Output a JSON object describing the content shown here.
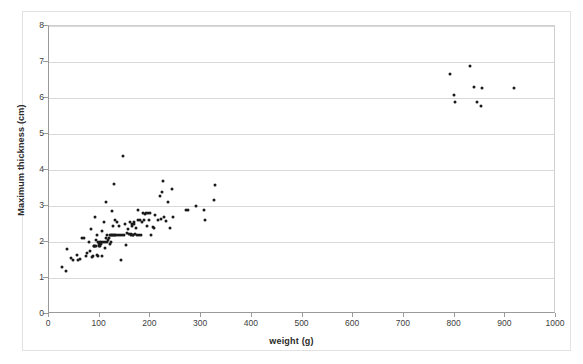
{
  "chart_data": {
    "type": "scatter",
    "title": "",
    "xlabel": "weight (g)",
    "ylabel": "Maximum thickness (cm)",
    "xlim": [
      0,
      1000
    ],
    "ylim": [
      0,
      8
    ],
    "xticks": [
      0,
      100,
      200,
      300,
      400,
      500,
      600,
      700,
      800,
      900,
      1000
    ],
    "yticks": [
      0,
      1,
      2,
      3,
      4,
      5,
      6,
      7,
      8
    ],
    "xtick_labels": [
      "0",
      "100",
      "200",
      "300",
      "400",
      "500",
      "600",
      "700",
      "800",
      "900",
      "1000"
    ],
    "ytick_labels": [
      "0",
      "1",
      "2",
      "3",
      "4",
      "5",
      "6",
      "7",
      "8"
    ],
    "grid": "horizontal",
    "legend": "none",
    "marker_color": "#1a1a1a",
    "marker_size": 3,
    "series": [
      {
        "name": "specimens",
        "points": [
          [
            25,
            1.3
          ],
          [
            34,
            1.2
          ],
          [
            36,
            1.8
          ],
          [
            44,
            1.55
          ],
          [
            48,
            1.5
          ],
          [
            55,
            1.65
          ],
          [
            58,
            1.5
          ],
          [
            62,
            1.52
          ],
          [
            66,
            2.1
          ],
          [
            70,
            2.1
          ],
          [
            72,
            1.62
          ],
          [
            75,
            1.7
          ],
          [
            78,
            2.0
          ],
          [
            80,
            1.75
          ],
          [
            82,
            2.35
          ],
          [
            84,
            1.58
          ],
          [
            86,
            1.6
          ],
          [
            88,
            1.9
          ],
          [
            89,
            1.9
          ],
          [
            90,
            2.7
          ],
          [
            91,
            1.9
          ],
          [
            92,
            1.9
          ],
          [
            93,
            2.05
          ],
          [
            94,
            2.2
          ],
          [
            95,
            1.65
          ],
          [
            96,
            1.6
          ],
          [
            97,
            2.0
          ],
          [
            98,
            1.95
          ],
          [
            99,
            1.9
          ],
          [
            100,
            2.0
          ],
          [
            101,
            1.9
          ],
          [
            102,
            2.0
          ],
          [
            103,
            1.95
          ],
          [
            104,
            1.62
          ],
          [
            105,
            2.3
          ],
          [
            106,
            2.0
          ],
          [
            108,
            2.55
          ],
          [
            110,
            1.82
          ],
          [
            111,
            2.0
          ],
          [
            112,
            2.1
          ],
          [
            113,
            3.1
          ],
          [
            114,
            2.0
          ],
          [
            115,
            2.2
          ],
          [
            116,
            2.05
          ],
          [
            118,
            2.1
          ],
          [
            120,
            2.2
          ],
          [
            121,
            1.95
          ],
          [
            122,
            2.2
          ],
          [
            123,
            2.0
          ],
          [
            124,
            2.2
          ],
          [
            125,
            2.85
          ],
          [
            126,
            2.2
          ],
          [
            127,
            2.45
          ],
          [
            128,
            3.6
          ],
          [
            129,
            2.2
          ],
          [
            130,
            2.2
          ],
          [
            131,
            2.6
          ],
          [
            132,
            2.2
          ],
          [
            134,
            2.55
          ],
          [
            136,
            2.2
          ],
          [
            138,
            2.45
          ],
          [
            140,
            2.2
          ],
          [
            142,
            1.5
          ],
          [
            144,
            2.2
          ],
          [
            146,
            4.4
          ],
          [
            148,
            2.2
          ],
          [
            150,
            2.5
          ],
          [
            152,
            1.92
          ],
          [
            154,
            2.25
          ],
          [
            156,
            2.35
          ],
          [
            158,
            2.22
          ],
          [
            160,
            2.55
          ],
          [
            161,
            2.22
          ],
          [
            162,
            2.2
          ],
          [
            163,
            2.5
          ],
          [
            164,
            2.45
          ],
          [
            165,
            2.2
          ],
          [
            166,
            2.2
          ],
          [
            167,
            2.55
          ],
          [
            168,
            2.5
          ],
          [
            170,
            2.22
          ],
          [
            172,
            2.4
          ],
          [
            174,
            2.2
          ],
          [
            175,
            2.9
          ],
          [
            176,
            2.6
          ],
          [
            178,
            2.2
          ],
          [
            180,
            2.6
          ],
          [
            182,
            2.2
          ],
          [
            184,
            2.55
          ],
          [
            186,
            2.8
          ],
          [
            188,
            2.62
          ],
          [
            190,
            2.78
          ],
          [
            192,
            2.8
          ],
          [
            194,
            2.45
          ],
          [
            196,
            2.8
          ],
          [
            198,
            2.62
          ],
          [
            200,
            2.8
          ],
          [
            202,
            2.2
          ],
          [
            205,
            2.42
          ],
          [
            208,
            2.4
          ],
          [
            210,
            2.75
          ],
          [
            215,
            2.6
          ],
          [
            218,
            3.28
          ],
          [
            220,
            2.65
          ],
          [
            222,
            3.4
          ],
          [
            224,
            3.7
          ],
          [
            226,
            2.7
          ],
          [
            230,
            2.58
          ],
          [
            234,
            3.1
          ],
          [
            238,
            2.4
          ],
          [
            242,
            3.48
          ],
          [
            245,
            2.7
          ],
          [
            270,
            2.9
          ],
          [
            275,
            2.9
          ],
          [
            290,
            3.0
          ],
          [
            305,
            2.9
          ],
          [
            308,
            2.62
          ],
          [
            325,
            3.18
          ],
          [
            328,
            3.58
          ],
          [
            790,
            6.68
          ],
          [
            798,
            6.08
          ],
          [
            800,
            5.88
          ],
          [
            830,
            6.88
          ],
          [
            838,
            6.3
          ],
          [
            845,
            5.9
          ],
          [
            852,
            5.78
          ],
          [
            855,
            6.28
          ],
          [
            918,
            6.27
          ]
        ]
      }
    ]
  },
  "axes": {
    "x_title": "weight (g)",
    "y_title": "Maximum thickness (cm)"
  }
}
